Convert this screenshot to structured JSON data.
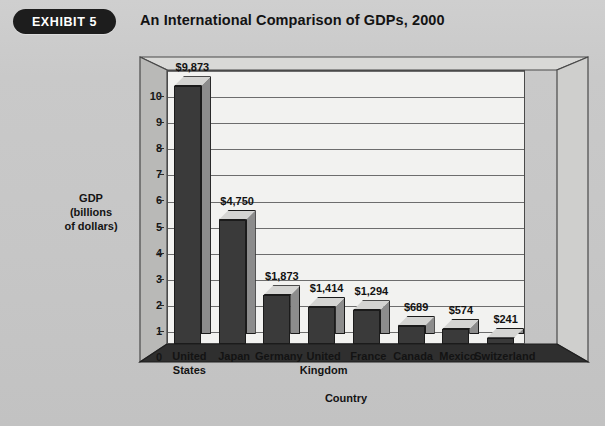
{
  "header": {
    "badge_label": "EXHIBIT 5",
    "title": "An International Comparison of GDPs, 2000"
  },
  "colors": {
    "page_background": "#c8c8c8",
    "badge_background": "#1d1d1d",
    "badge_text": "#ffffff",
    "plot_background": "#f2f2f0",
    "bar_front": "#3a3a3a",
    "bar_top": "#d4d4d2",
    "bar_side": "#8c8c8c",
    "frame_line": "#4a4a4a",
    "gridline": "#6d6d6d",
    "text": "#131313"
  },
  "chart_data": {
    "type": "bar",
    "title": "An International Comparison of GDPs, 2000",
    "xlabel": "Country",
    "ylabel": "GDP (billions of dollars)",
    "ylabel_lines": [
      "GDP",
      "(billions",
      "of dollars)"
    ],
    "categories": [
      "United States",
      "Japan",
      "Germany",
      "United Kingdom",
      "France",
      "Canada",
      "Mexico",
      "Switzerland"
    ],
    "category_lines": [
      [
        "United",
        "States"
      ],
      [
        "Japan"
      ],
      [
        "Germany"
      ],
      [
        "United",
        "Kingdom"
      ],
      [
        "France"
      ],
      [
        "Canada"
      ],
      [
        "Mexico"
      ],
      [
        "Switzerland"
      ]
    ],
    "values": [
      9873,
      4750,
      1873,
      1414,
      1294,
      689,
      574,
      241
    ],
    "value_labels": [
      "$9,873",
      "$4,750",
      "$1,873",
      "$1,414",
      "$1,294",
      "$689",
      "$574",
      "$241"
    ],
    "value_units": "billions of dollars",
    "ylim": [
      0,
      10.5
    ],
    "yticks": [
      0,
      1,
      2,
      3,
      4,
      5,
      6,
      7,
      8,
      9,
      10
    ],
    "ytick_labels": [
      "0",
      "1",
      "2",
      "3",
      "4",
      "5",
      "6",
      "7",
      "8",
      "9",
      "10"
    ],
    "grid": true,
    "legend": false,
    "three_d": true
  }
}
